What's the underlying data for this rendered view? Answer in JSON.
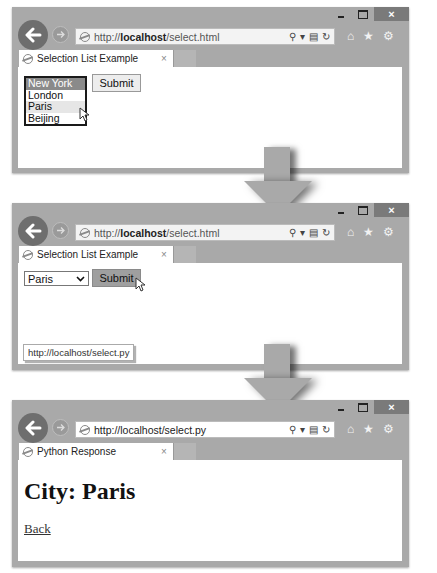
{
  "windows": [
    {
      "address": {
        "prefix": "http://",
        "host": "localhost",
        "path": "/select.html"
      },
      "tab": {
        "title": "Selection List Example",
        "close": "×"
      },
      "caption": {
        "minimize": "–",
        "maximize": "□",
        "close": "×"
      },
      "content": {
        "listbox_options": [
          "New York",
          "London",
          "Paris",
          "Beijing"
        ],
        "selected_option": "New York",
        "hovered_option": "Paris",
        "submit_label": "Submit"
      }
    },
    {
      "address": {
        "prefix": "http://",
        "host": "localhost",
        "path": "/select.html"
      },
      "tab": {
        "title": "Selection List Example",
        "close": "×"
      },
      "caption": {
        "minimize": "–",
        "maximize": "□",
        "close": "×"
      },
      "content": {
        "dropdown_value": "Paris",
        "dropdown_chevron": "⌄",
        "submit_label": "Submit",
        "status_url": "http://localhost/select.py"
      }
    },
    {
      "address": {
        "full": "http://localhost/select.py"
      },
      "tab": {
        "title": "Python Response",
        "close": "×"
      },
      "caption": {
        "minimize": "–",
        "maximize": "□",
        "close": "×"
      },
      "content": {
        "heading": "City: Paris",
        "back_link": "Back"
      }
    }
  ],
  "toolbar_icons": {
    "back": "←",
    "forward": "→",
    "search": "⚲",
    "dropdown": "▾",
    "compat": "▤",
    "refresh": "↻",
    "home": "⌂",
    "favorites": "★",
    "settings": "⚙"
  },
  "colors": {
    "frame": "#a9a9a9",
    "selected_option_bg": "#8a8a8a",
    "hot_button_bg": "#9f9f9f",
    "close_button_bg": "#7a7a7a"
  }
}
